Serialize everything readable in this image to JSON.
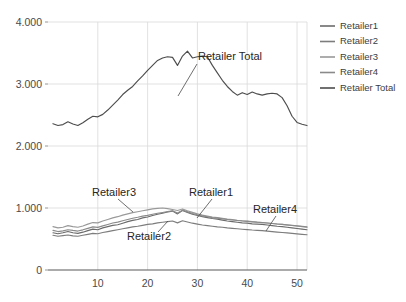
{
  "chart_data": {
    "type": "line",
    "title": "",
    "xlabel": "",
    "ylabel": "",
    "xlim": [
      0,
      52
    ],
    "ylim": [
      0,
      4000
    ],
    "grid": true,
    "grid_color": "#d9d9d9",
    "background": "#ffffff",
    "legend_position": "right",
    "y_ticks": [
      0,
      1000,
      2000,
      3000,
      4000
    ],
    "y_tick_labels": [
      "0",
      "1.000",
      "2.000",
      "3.000",
      "4.000"
    ],
    "x_ticks": [
      10,
      20,
      30,
      40,
      50
    ],
    "x_tick_labels": [
      "10",
      "20",
      "30",
      "40",
      "50"
    ],
    "x": [
      1,
      2,
      3,
      4,
      5,
      6,
      7,
      8,
      9,
      10,
      11,
      12,
      13,
      14,
      15,
      16,
      17,
      18,
      19,
      20,
      21,
      22,
      23,
      24,
      25,
      26,
      27,
      28,
      29,
      30,
      31,
      32,
      33,
      34,
      35,
      36,
      37,
      38,
      39,
      40,
      41,
      42,
      43,
      44,
      45,
      46,
      47,
      48,
      49,
      50,
      51,
      52
    ],
    "series": [
      {
        "name": "Retailer1",
        "color": "#6b6b6b",
        "values": [
          600,
          585,
          600,
          620,
          600,
          590,
          610,
          635,
          660,
          650,
          680,
          700,
          720,
          730,
          755,
          780,
          800,
          815,
          840,
          855,
          880,
          900,
          915,
          935,
          950,
          905,
          960,
          930,
          900,
          880,
          860,
          845,
          830,
          820,
          805,
          790,
          780,
          770,
          760,
          755,
          745,
          740,
          735,
          725,
          715,
          705,
          700,
          690,
          680,
          670,
          660,
          650
        ]
      },
      {
        "name": "Retailer2",
        "color": "#7d7d7d",
        "values": [
          560,
          545,
          555,
          565,
          550,
          545,
          560,
          575,
          590,
          585,
          605,
          620,
          635,
          650,
          665,
          680,
          695,
          705,
          720,
          735,
          745,
          760,
          770,
          780,
          790,
          760,
          795,
          775,
          755,
          740,
          725,
          715,
          705,
          695,
          690,
          680,
          672,
          665,
          658,
          652,
          645,
          640,
          635,
          628,
          620,
          612,
          605,
          598,
          590,
          582,
          575,
          568
        ]
      },
      {
        "name": "Retailer3",
        "color": "#999999",
        "values": [
          700,
          680,
          690,
          715,
          700,
          690,
          710,
          740,
          765,
          760,
          790,
          815,
          840,
          860,
          885,
          905,
          925,
          940,
          955,
          970,
          985,
          995,
          1000,
          990,
          975,
          960,
          985,
          955,
          930,
          905,
          885,
          870,
          855,
          845,
          832,
          820,
          812,
          802,
          795,
          788,
          780,
          772,
          766,
          758,
          750,
          742,
          735,
          726,
          718,
          710,
          700,
          690
        ]
      },
      {
        "name": "Retailer4",
        "color": "#8a8a8a",
        "values": [
          640,
          620,
          632,
          650,
          638,
          628,
          648,
          672,
          695,
          688,
          712,
          735,
          758,
          772,
          795,
          815,
          835,
          850,
          868,
          882,
          900,
          915,
          928,
          942,
          955,
          920,
          965,
          938,
          912,
          890,
          872,
          858,
          845,
          836,
          824,
          815,
          806,
          798,
          790,
          784,
          776,
          770,
          765,
          758,
          750,
          742,
          736,
          728,
          720,
          712,
          704,
          696
        ]
      },
      {
        "name": "Retailer Total",
        "color": "#4d4d4d",
        "values": [
          2360,
          2330,
          2345,
          2390,
          2355,
          2330,
          2375,
          2430,
          2480,
          2470,
          2510,
          2580,
          2660,
          2740,
          2830,
          2900,
          2960,
          3050,
          3130,
          3220,
          3300,
          3380,
          3420,
          3440,
          3430,
          3300,
          3450,
          3530,
          3420,
          3440,
          3450,
          3440,
          3300,
          3180,
          3060,
          2960,
          2880,
          2820,
          2860,
          2830,
          2870,
          2840,
          2820,
          2840,
          2850,
          2840,
          2780,
          2650,
          2480,
          2380,
          2350,
          2330
        ]
      }
    ],
    "annotations": [
      {
        "label": "Retailer Total",
        "x": 198,
        "y": 60,
        "leader": [
          [
            197,
            64
          ],
          [
            178,
            96
          ]
        ]
      },
      {
        "label": "Retailer3",
        "x": 92,
        "y": 196,
        "leader": [
          [
            118,
            199
          ],
          [
            133,
            212
          ]
        ]
      },
      {
        "label": "Retailer1",
        "x": 189,
        "y": 196,
        "leader": [
          [
            212,
            199
          ],
          [
            197,
            218
          ]
        ]
      },
      {
        "label": "Retailer2",
        "x": 127,
        "y": 240,
        "leader": [
          [
            158,
            232
          ],
          [
            168,
            221
          ]
        ]
      },
      {
        "label": "Retailer4",
        "x": 253,
        "y": 213,
        "leader": [
          [
            276,
            216
          ],
          [
            266,
            231
          ]
        ]
      }
    ]
  },
  "legend": {
    "items": [
      {
        "label": "Retailer1",
        "color": "#6b6b6b"
      },
      {
        "label": "Retailer2",
        "color": "#7d7d7d"
      },
      {
        "label": "Retailer3",
        "color": "#999999"
      },
      {
        "label": "Retailer4",
        "color": "#8a8a8a"
      },
      {
        "label": "Retailer Total",
        "color": "#4d4d4d"
      }
    ]
  }
}
